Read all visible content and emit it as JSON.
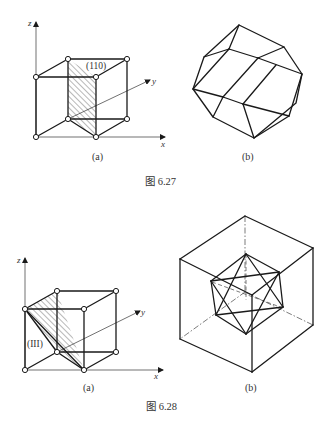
{
  "figures": [
    {
      "caption": "图 6.27",
      "panels": [
        {
          "label": "(a)",
          "description": "Cubic unit cell with shaded (110) plane",
          "plane_label": "(110)",
          "axes": {
            "x": "x",
            "y": "y",
            "z": "z"
          }
        },
        {
          "label": "(b)",
          "description": "Rhombic dodecahedron wireframe"
        }
      ]
    },
    {
      "caption": "图 6.28",
      "panels": [
        {
          "label": "(a)",
          "description": "Cubic unit cell with shaded (111) plane",
          "plane_label": "(III)",
          "axes": {
            "x": "x",
            "y": "y",
            "z": "z"
          }
        },
        {
          "label": "(b)",
          "description": "Octahedron-like wireframe inscribed in a large cube with dashed hidden edges"
        }
      ]
    }
  ],
  "colors": {
    "line": "#1a1a1a",
    "background": "#ffffff",
    "text": "#333333"
  }
}
